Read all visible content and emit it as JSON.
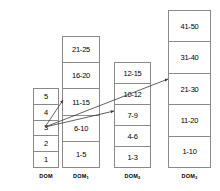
{
  "diagram": {
    "columns": [
      {
        "id": "dom-base",
        "label_base": "DOM",
        "label_sub": "",
        "x": 33,
        "y": 88,
        "width": 26,
        "height": 80,
        "font_size": 7.5,
        "cells": [
          "5",
          "4",
          "3",
          "2",
          "1"
        ]
      },
      {
        "id": "dom-1",
        "label_base": "DOM",
        "label_sub": "1",
        "x": 62,
        "y": 36,
        "width": 38,
        "height": 132,
        "font_size": 7.5,
        "cells": [
          "21-25",
          "16-20",
          "11-15",
          "6-10",
          "1-5"
        ]
      },
      {
        "id": "dom-2",
        "label_base": "DOM",
        "label_sub": "2",
        "x": 114,
        "y": 62,
        "width": 37,
        "height": 106,
        "font_size": 7.5,
        "cells": [
          "12-15",
          "10-12",
          "7-9",
          "4-6",
          "1-3"
        ]
      },
      {
        "id": "dom-3",
        "label_base": "DOM",
        "label_sub": "3",
        "x": 168,
        "y": 10,
        "width": 43,
        "height": 158,
        "font_size": 7.5,
        "cells": [
          "41-50",
          "31-40",
          "21-30",
          "11-20",
          "1-10"
        ]
      }
    ],
    "arrows": [
      {
        "id": "arrow-to-dom1",
        "from_cell": "3",
        "to_column": "dom-1",
        "to_cell": "11-15",
        "x1": 45,
        "y1": 127,
        "x2": 63,
        "y2": 100
      },
      {
        "id": "arrow-to-dom2",
        "from_cell": "3",
        "to_column": "dom-2",
        "to_cell": "7-9",
        "x1": 45,
        "y1": 127,
        "x2": 114,
        "y2": 111
      },
      {
        "id": "arrow-to-dom3",
        "from_cell": "3",
        "to_column": "dom-3",
        "to_cell": "21-30",
        "x1": 45,
        "y1": 127,
        "x2": 168,
        "y2": 79
      }
    ],
    "colors": {
      "border": "#8a8a8a",
      "text": "#000000",
      "arrow": "#3a3a3a",
      "background": "#ffffff"
    }
  }
}
